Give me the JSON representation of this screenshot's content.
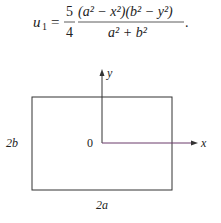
{
  "equation": {
    "lhs_var": "u",
    "lhs_sub": "1",
    "equals": "=",
    "coef_num": "5",
    "coef_den": "4",
    "numerator": "(a² − x²)(b² − y²)",
    "denominator": "a² + b²",
    "trailing": "."
  },
  "figure": {
    "y_axis_label": "y",
    "x_axis_label": "x",
    "origin_label": "0",
    "height_label": "2b",
    "width_label": "2a",
    "colors": {
      "line": "#333333",
      "x_axis": "#6b3a6b"
    }
  }
}
